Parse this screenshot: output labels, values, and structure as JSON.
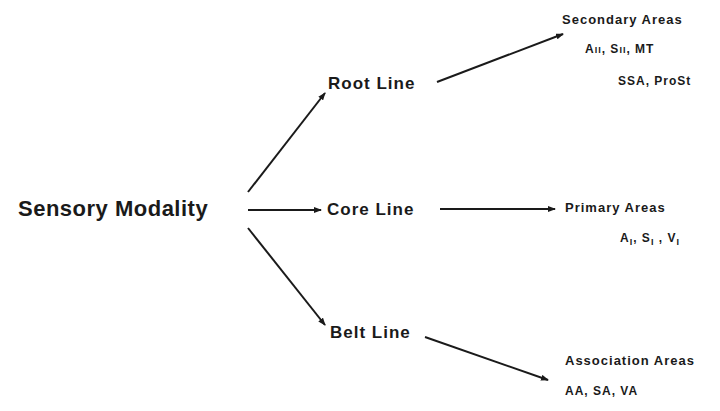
{
  "diagram": {
    "source": {
      "label": "Sensory Modality"
    },
    "lines": [
      {
        "label": "Root Line",
        "target": {
          "title": "Secondary Areas",
          "examples": [
            {
              "base": "A",
              "mark": "II",
              "mark_style": "small-caps",
              "sep": ", "
            },
            {
              "base": "S",
              "mark": "II",
              "mark_style": "small-caps",
              "sep": ", "
            },
            {
              "base": "MT",
              "mark": "",
              "sep": ""
            }
          ],
          "examples_line2": "SSA, ProSt"
        }
      },
      {
        "label": "Core Line",
        "target": {
          "title": "Primary Areas",
          "examples": [
            {
              "base": "A",
              "mark": "I",
              "mark_style": "subscript",
              "sep": ", "
            },
            {
              "base": "S",
              "mark": "I",
              "mark_style": "subscript",
              "sep": " , "
            },
            {
              "base": "V",
              "mark": "I",
              "mark_style": "subscript",
              "sep": ""
            }
          ]
        }
      },
      {
        "label": "Belt Line",
        "target": {
          "title": "Association Areas",
          "examples_text": "AA, SA, VA"
        }
      }
    ],
    "colors": {
      "ink": "#1a1a1a",
      "background": "#ffffff"
    }
  }
}
